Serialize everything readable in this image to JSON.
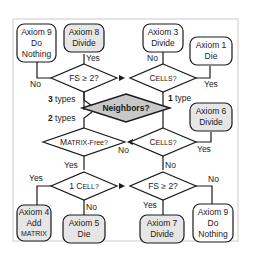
{
  "diagram": {
    "colors": {
      "frame": "#cccccc",
      "stroke": "#1a1a1a",
      "decision_fill": "#ffffff",
      "root_fill": "#c8c8c8",
      "gray_box_fill": "#e6e6e6",
      "white_box_fill": "#ffffff"
    },
    "root": {
      "label": "Neighbors?"
    },
    "decisions": {
      "fs_top": "FS ≥ 2?",
      "cells_top_C": "C",
      "cells_top_rest": "ELLS?",
      "matrix_free_M": "M",
      "matrix_free_rest": "ATRIX-Free?",
      "cells_mid_C": "C",
      "cells_mid_rest": "ELLS?",
      "one_cell_pre": "1 C",
      "one_cell_rest": "ELL?",
      "fs_bottom": "FS ≥ 2?"
    },
    "axioms": {
      "a9_top": [
        "Axiom 9",
        "Do",
        "Nothing"
      ],
      "a8": [
        "Axiom 8",
        "Divide"
      ],
      "a3": [
        "Axiom 3",
        "Divide"
      ],
      "a1": [
        "Axiom 1",
        "Die"
      ],
      "a6": [
        "Axiom 6",
        "Divide"
      ],
      "a4": [
        "Axiom 4",
        "Add",
        "MATRIX"
      ],
      "a5": [
        "Axiom 5",
        "Die"
      ],
      "a7": [
        "Axiom 7",
        "Divide"
      ],
      "a9_bottom": [
        "Axiom 9",
        "Do",
        "Nothing"
      ]
    },
    "edges": {
      "three_types_num": "3",
      "three_types_text": " types",
      "two_types_num": "2",
      "two_types_text": " types",
      "one_type_num": "1",
      "one_type_text": " type",
      "fs_top_yes": "Yes",
      "fs_top_no": "No",
      "cells_top_no": "No",
      "cells_top_yes": "Yes",
      "matrix_free_no": "No",
      "matrix_free_yes": "Yes",
      "cells_mid_no": "No",
      "cells_mid_yes": "Yes",
      "one_cell_yes": "Yes",
      "one_cell_no": "No",
      "fs_bottom_yes": "Yes",
      "fs_bottom_no": "No"
    }
  }
}
